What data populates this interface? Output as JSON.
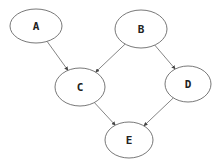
{
  "diagram": {
    "type": "directed-graph",
    "nodes": [
      {
        "id": "A",
        "label": "A",
        "cx": 36,
        "cy": 26,
        "rx": 26,
        "ry": 17
      },
      {
        "id": "B",
        "label": "B",
        "cx": 141,
        "cy": 29,
        "rx": 26,
        "ry": 19
      },
      {
        "id": "C",
        "label": "C",
        "cx": 80,
        "cy": 87,
        "rx": 25,
        "ry": 19
      },
      {
        "id": "D",
        "label": "D",
        "cx": 188,
        "cy": 84,
        "rx": 23,
        "ry": 18
      },
      {
        "id": "E",
        "label": "E",
        "cx": 129,
        "cy": 140,
        "rx": 24,
        "ry": 18
      }
    ],
    "edges": [
      {
        "from": "A",
        "to": "C"
      },
      {
        "from": "B",
        "to": "C"
      },
      {
        "from": "B",
        "to": "D"
      },
      {
        "from": "C",
        "to": "E"
      },
      {
        "from": "D",
        "to": "E"
      }
    ]
  }
}
